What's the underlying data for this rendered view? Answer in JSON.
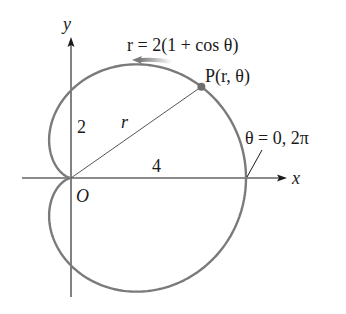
{
  "diagram": {
    "equation_label": "r = 2(1 + cos θ)",
    "point_label": "P(r, θ)",
    "radius_label": "r",
    "origin_label": "O",
    "x_axis_label": "x",
    "y_axis_label": "y",
    "y_intercept_label": "2",
    "x_intercept_label": "4",
    "angle_label": "θ = 0, 2π",
    "colors": {
      "curve": "#7a7a7a",
      "axes": "#1a1a1a",
      "text": "#1a1a1a",
      "point": "#6e6e6e"
    }
  }
}
